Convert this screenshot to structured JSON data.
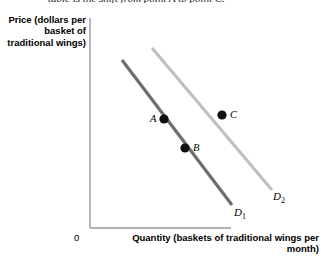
{
  "caption": {
    "text": "table is the shift from point A to point C."
  },
  "chart_data": {
    "type": "line",
    "title": "",
    "ylabel": "Price (dollars per basket of traditional wings)",
    "xlabel": "Quantity (baskets of traditional wings per month)",
    "origin_label": "0",
    "grid": false,
    "legend": "inline-curve-labels",
    "xlim": [
      0,
      100
    ],
    "ylim": [
      0,
      100
    ],
    "axis_ticks": [],
    "series": [
      {
        "name": "D1",
        "label": "D",
        "subscript": "1",
        "color": "#6e6e6e",
        "line_width": 3,
        "start": {
          "x": 122,
          "y": 60
        },
        "end": {
          "x": 232,
          "y": 205
        },
        "description": "original demand curve, downward sloping"
      },
      {
        "name": "D2",
        "label": "D",
        "subscript": "2",
        "color": "#c0c0c0",
        "line_width": 3,
        "start": {
          "x": 152,
          "y": 48
        },
        "end": {
          "x": 272,
          "y": 190
        },
        "description": "shifted demand curve, downward sloping, to the right of D1"
      }
    ],
    "points": [
      {
        "name": "A",
        "label": "A",
        "x": 164,
        "y": 119,
        "on_curve": "D1",
        "label_side": "left"
      },
      {
        "name": "B",
        "label": "B",
        "x": 185,
        "y": 148,
        "on_curve": "D1",
        "label_side": "right"
      },
      {
        "name": "C",
        "label": "C",
        "x": 222,
        "y": 115,
        "on_curve": "D2",
        "label_side": "right"
      }
    ],
    "axes": {
      "color": "#999999",
      "y_axis": {
        "x": 90,
        "y_top": 18,
        "y_bottom": 228
      },
      "x_axis": {
        "y": 228,
        "x_left": 90,
        "x_right": 231
      }
    }
  }
}
